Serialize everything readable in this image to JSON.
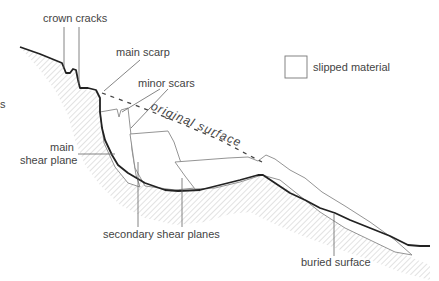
{
  "diagram": {
    "labels": {
      "crown_cracks": "crown cracks",
      "main_scarp": "main scarp",
      "minor_scars": "minor scars",
      "original_surface": "original surface",
      "main_shear_plane_1": "main",
      "main_shear_plane_2": "shear plane",
      "secondary_shear_planes": "secondary shear planes",
      "buried_surface": "buried surface"
    },
    "legend": {
      "items": [
        {
          "swatch": "white-box",
          "label": "slipped material"
        }
      ]
    },
    "edge_fragment": "s",
    "colors": {
      "ground_line": "#222222",
      "slipped_outline": "#777777",
      "leader_line": "#666666",
      "hatch": "#cccccc",
      "text": "#444444"
    }
  }
}
